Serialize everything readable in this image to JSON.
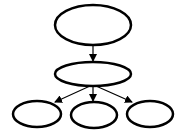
{
  "diagram": {
    "type": "tree",
    "stroke_color": "#000000",
    "background": "#ffffff",
    "nodes": [
      {
        "id": "root",
        "label": "",
        "cx": 93,
        "cy": 25,
        "rx": 38,
        "ry": 20
      },
      {
        "id": "middle",
        "label": "",
        "cx": 93,
        "cy": 74,
        "rx": 38,
        "ry": 12
      },
      {
        "id": "leaf-left",
        "label": "",
        "cx": 37,
        "cy": 114,
        "rx": 24,
        "ry": 13
      },
      {
        "id": "leaf-center",
        "label": "",
        "cx": 94,
        "cy": 115,
        "rx": 23,
        "ry": 13
      },
      {
        "id": "leaf-right",
        "label": "",
        "cx": 150,
        "cy": 114,
        "rx": 23,
        "ry": 13
      }
    ],
    "edges": [
      {
        "from": "root",
        "to": "middle"
      },
      {
        "from": "middle",
        "to": "leaf-left"
      },
      {
        "from": "middle",
        "to": "leaf-center"
      },
      {
        "from": "middle",
        "to": "leaf-right"
      }
    ]
  }
}
